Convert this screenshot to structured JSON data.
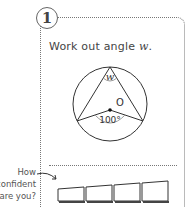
{
  "question": {
    "number": "1",
    "text_prefix": "Work out angle ",
    "variable": "w",
    "text_suffix": "."
  },
  "diagram": {
    "center_label": "O",
    "angle_top_label": "w",
    "angle_center_label": "100°"
  },
  "confidence": {
    "prompt_lines": [
      "How",
      "confident",
      "are you?"
    ],
    "levels": 4
  }
}
